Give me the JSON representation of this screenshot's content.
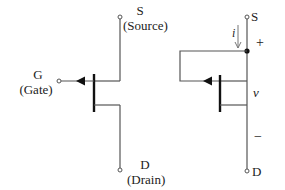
{
  "diagram": {
    "left_symbol": {
      "source_letter": "S",
      "source_name": "(Source)",
      "gate_letter": "G",
      "gate_name": "(Gate)",
      "drain_letter": "D",
      "drain_name": "(Drain)"
    },
    "right_symbol": {
      "source_letter": "S",
      "drain_letter": "D",
      "current_label": "i",
      "voltage_label": "v",
      "plus_sign": "+",
      "minus_sign": "−"
    },
    "colors": {
      "line": "#555555",
      "bar": "#111111",
      "text": "#222222"
    }
  }
}
